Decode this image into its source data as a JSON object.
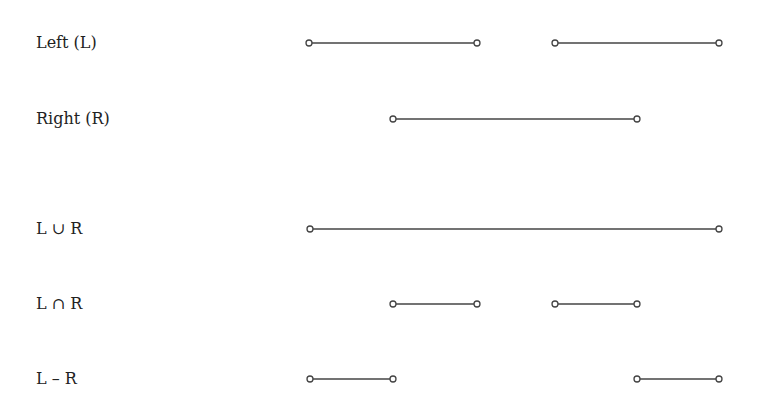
{
  "diagram": {
    "rows": [
      {
        "label": "Left (L)",
        "y": 43,
        "segments": [
          [
            309,
            477
          ],
          [
            555,
            719
          ]
        ]
      },
      {
        "label": "Right (R)",
        "y": 119,
        "segments": [
          [
            393,
            637
          ]
        ]
      },
      {
        "label": "L ∪ R",
        "y": 229,
        "segments": [
          [
            310,
            719
          ]
        ]
      },
      {
        "label": "L ∩ R",
        "y": 304,
        "segments": [
          [
            393,
            477
          ],
          [
            555,
            637
          ]
        ]
      },
      {
        "label": "L – R",
        "y": 379,
        "segments": [
          [
            310,
            393
          ],
          [
            637,
            719
          ]
        ]
      }
    ],
    "colors": {
      "line": "#444444",
      "text": "#222222"
    }
  }
}
